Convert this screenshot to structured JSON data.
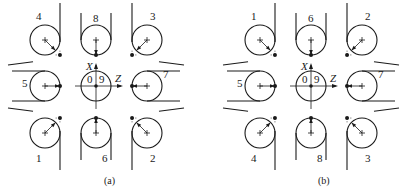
{
  "figure": {
    "radius": 15,
    "panels": [
      {
        "id": "a",
        "caption": "(a)",
        "caption_pos": [
          104,
          184
        ],
        "cols": [
          45,
          96,
          147
        ],
        "rows": [
          40,
          86,
          133
        ],
        "axes": {
          "x_label": "X",
          "z_label": "Z",
          "label_0": "0",
          "label_9": "9"
        },
        "cells": [
          {
            "label": "4",
            "row": 0,
            "col": 0,
            "type": "corner",
            "tool_dir": "SE",
            "line_dir": "NW-slope",
            "label_pos": "top"
          },
          {
            "label": "8",
            "row": 0,
            "col": 1,
            "type": "side",
            "tool_dir": "S",
            "label_pos": "top"
          },
          {
            "label": "3",
            "row": 0,
            "col": 2,
            "type": "corner",
            "tool_dir": "SW",
            "line_dir": "NE-slope",
            "label_pos": "top"
          },
          {
            "label": "5",
            "row": 1,
            "col": 0,
            "type": "side",
            "tool_dir": "E",
            "label_pos": "left"
          },
          {
            "label": "center",
            "row": 1,
            "col": 1,
            "type": "origin"
          },
          {
            "label": "7",
            "row": 1,
            "col": 2,
            "type": "side",
            "tool_dir": "W",
            "label_pos": "right"
          },
          {
            "label": "1",
            "row": 2,
            "col": 0,
            "type": "corner",
            "tool_dir": "NE",
            "line_dir": "SW-slope",
            "label_pos": "bottom"
          },
          {
            "label": "6",
            "row": 2,
            "col": 1,
            "type": "side",
            "tool_dir": "N",
            "label_pos": "bottom"
          },
          {
            "label": "2",
            "row": 2,
            "col": 2,
            "type": "corner",
            "tool_dir": "NW",
            "line_dir": "SE-slope",
            "label_pos": "bottom"
          }
        ]
      },
      {
        "id": "b",
        "caption": "(b)",
        "caption_pos": [
          318,
          184
        ],
        "cols": [
          260,
          311,
          362
        ],
        "rows": [
          40,
          86,
          133
        ],
        "axes": {
          "x_label": "X",
          "z_label": "Z",
          "label_0": "0",
          "label_9": "9"
        },
        "cells": [
          {
            "label": "1",
            "row": 0,
            "col": 0,
            "type": "corner",
            "tool_dir": "SE",
            "line_dir": "NW-slope",
            "label_pos": "top"
          },
          {
            "label": "6",
            "row": 0,
            "col": 1,
            "type": "side",
            "tool_dir": "S",
            "label_pos": "top"
          },
          {
            "label": "2",
            "row": 0,
            "col": 2,
            "type": "corner",
            "tool_dir": "SW",
            "line_dir": "NE-slope",
            "label_pos": "top"
          },
          {
            "label": "5",
            "row": 1,
            "col": 0,
            "type": "side",
            "tool_dir": "E",
            "label_pos": "left"
          },
          {
            "label": "center",
            "row": 1,
            "col": 1,
            "type": "origin"
          },
          {
            "label": "7",
            "row": 1,
            "col": 2,
            "type": "side",
            "tool_dir": "W",
            "label_pos": "right"
          },
          {
            "label": "4",
            "row": 2,
            "col": 0,
            "type": "corner",
            "tool_dir": "NE",
            "line_dir": "SW-slope",
            "label_pos": "bottom"
          },
          {
            "label": "8",
            "row": 2,
            "col": 1,
            "type": "side",
            "tool_dir": "N",
            "label_pos": "bottom"
          },
          {
            "label": "3",
            "row": 2,
            "col": 2,
            "type": "corner",
            "tool_dir": "NW",
            "line_dir": "SE-slope",
            "label_pos": "bottom"
          }
        ]
      }
    ]
  }
}
